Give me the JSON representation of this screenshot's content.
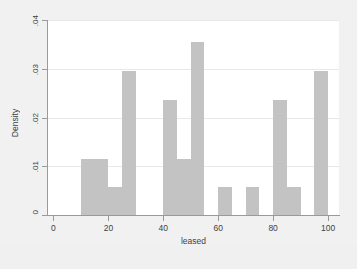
{
  "figure": {
    "background_color": "#f1f1f1",
    "plot_background_color": "#ffffff",
    "bar_color": "#c3c3c3",
    "axis_color": "#9a9a9a",
    "grid_color": "#e8e8e8"
  },
  "chart_data": {
    "type": "bar",
    "title": "",
    "subtitle": "",
    "xlabel": "leased",
    "ylabel": "Density",
    "xlim": [
      -2,
      104
    ],
    "ylim": [
      0,
      0.04
    ],
    "xticks": [
      0,
      20,
      40,
      60,
      80,
      100
    ],
    "xtick_labels": [
      "0",
      "20",
      "40",
      "60",
      "80",
      "100"
    ],
    "yticks": [
      0,
      0.01,
      0.02,
      0.03,
      0.04
    ],
    "ytick_labels": [
      "0",
      ".01",
      ".02",
      ".03",
      ".04"
    ],
    "grid": "horizontal",
    "legend": null,
    "bin_width": 5,
    "bins": [
      {
        "x0": 10,
        "x1": 15,
        "value": 0.0115
      },
      {
        "x0": 15,
        "x1": 20,
        "value": 0.0115
      },
      {
        "x0": 20,
        "x1": 25,
        "value": 0.0058
      },
      {
        "x0": 25,
        "x1": 30,
        "value": 0.0295
      },
      {
        "x0": 40,
        "x1": 45,
        "value": 0.0235
      },
      {
        "x0": 45,
        "x1": 50,
        "value": 0.0115
      },
      {
        "x0": 50,
        "x1": 55,
        "value": 0.0355
      },
      {
        "x0": 60,
        "x1": 65,
        "value": 0.0058
      },
      {
        "x0": 70,
        "x1": 75,
        "value": 0.0058
      },
      {
        "x0": 80,
        "x1": 85,
        "value": 0.0235
      },
      {
        "x0": 85,
        "x1": 90,
        "value": 0.0058
      },
      {
        "x0": 95,
        "x1": 100,
        "value": 0.0295
      }
    ]
  }
}
